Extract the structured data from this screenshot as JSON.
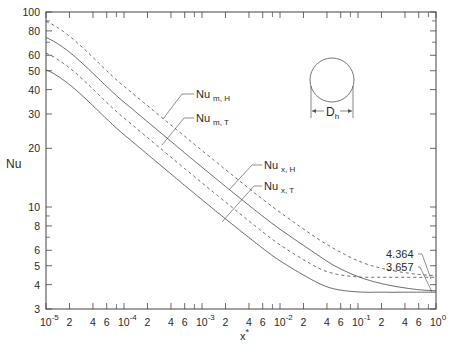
{
  "chart_data": {
    "type": "line",
    "title": "",
    "xlabel": "x*",
    "ylabel": "Nu",
    "xscale": "log",
    "yscale": "log",
    "xlim": [
      1e-05,
      1
    ],
    "ylim": [
      3,
      100
    ],
    "grid": false,
    "x_tick_labels": [
      {
        "value": 1e-05,
        "base": "10",
        "exp": "-5"
      },
      {
        "value": 2e-05,
        "label": "2"
      },
      {
        "value": 4e-05,
        "label": "4"
      },
      {
        "value": 6e-05,
        "label": "6"
      },
      {
        "value": 0.0001,
        "base": "10",
        "exp": "-4"
      },
      {
        "value": 0.0002,
        "label": "2"
      },
      {
        "value": 0.0004,
        "label": "4"
      },
      {
        "value": 0.0006,
        "label": "6"
      },
      {
        "value": 0.001,
        "base": "10",
        "exp": "-3"
      },
      {
        "value": 0.002,
        "label": "2"
      },
      {
        "value": 0.004,
        "label": "4"
      },
      {
        "value": 0.006,
        "label": "6"
      },
      {
        "value": 0.01,
        "base": "10",
        "exp": "-2"
      },
      {
        "value": 0.02,
        "label": "2"
      },
      {
        "value": 0.04,
        "label": "4"
      },
      {
        "value": 0.06,
        "label": "6"
      },
      {
        "value": 0.1,
        "base": "10",
        "exp": "-1"
      },
      {
        "value": 0.2,
        "label": "2"
      },
      {
        "value": 0.4,
        "label": "4"
      },
      {
        "value": 0.6,
        "label": "6"
      },
      {
        "value": 1,
        "base": "10",
        "exp": "0"
      }
    ],
    "y_tick_labels": [
      {
        "value": 3,
        "label": "3"
      },
      {
        "value": 4,
        "label": "4"
      },
      {
        "value": 5,
        "label": "5"
      },
      {
        "value": 6,
        "label": "6"
      },
      {
        "value": 8,
        "label": "8"
      },
      {
        "value": 10,
        "label": "10"
      },
      {
        "value": 20,
        "label": "20"
      },
      {
        "value": 30,
        "label": "30"
      },
      {
        "value": 40,
        "label": "40"
      },
      {
        "value": 50,
        "label": "50"
      },
      {
        "value": 60,
        "label": "60"
      },
      {
        "value": 80,
        "label": "80"
      },
      {
        "value": 100,
        "label": "100"
      }
    ],
    "series": [
      {
        "name": "Nu m,H",
        "label_main": "Nu",
        "label_sub": "m, H",
        "style": "dashed",
        "x": [
          1e-05,
          0.0001,
          0.001,
          0.005,
          0.01,
          0.03,
          0.05,
          0.1,
          0.2,
          0.5,
          1
        ],
        "values": [
          89.5,
          41.6,
          19.5,
          11.6,
          9.4,
          6.9,
          6.1,
          5.3,
          4.85,
          4.55,
          4.45
        ]
      },
      {
        "name": "Nu m,T",
        "label_main": "Nu",
        "label_sub": "m, T",
        "style": "solid",
        "x": [
          1e-05,
          0.0001,
          0.001,
          0.005,
          0.01,
          0.03,
          0.05,
          0.1,
          0.2,
          0.5,
          1
        ],
        "values": [
          74,
          34.5,
          16.0,
          9.5,
          7.7,
          5.7,
          5.0,
          4.4,
          4.05,
          3.8,
          3.72
        ]
      },
      {
        "name": "Nu x,H",
        "label_main": "Nu",
        "label_sub": "x, H",
        "style": "dashed",
        "x": [
          1e-05,
          0.0001,
          0.001,
          0.005,
          0.01,
          0.03,
          0.05,
          0.1,
          0.2,
          0.5,
          1
        ],
        "values": [
          61.5,
          28.6,
          13.3,
          7.9,
          6.4,
          4.9,
          4.55,
          4.38,
          4.364,
          4.364,
          4.364
        ]
      },
      {
        "name": "Nu x,T",
        "label_main": "Nu",
        "label_sub": "x, T",
        "style": "solid",
        "x": [
          1e-05,
          0.0001,
          0.001,
          0.005,
          0.01,
          0.03,
          0.05,
          0.1,
          0.2,
          0.5,
          1
        ],
        "values": [
          50.5,
          23.5,
          10.9,
          6.5,
          5.3,
          4.1,
          3.8,
          3.67,
          3.657,
          3.657,
          3.657
        ]
      }
    ],
    "annotations": [
      {
        "text": "4.364",
        "points_to": "fully developed Nu x,H / Nu m,H asymptote at x* = 1"
      },
      {
        "text": "3.657",
        "points_to": "fully developed Nu x,T / Nu m,T asymptote at x* = 1"
      },
      {
        "text": "D_h",
        "description": "circular duct cross-section with hydraulic diameter dimension"
      }
    ],
    "legend": "inline leader-line labels"
  },
  "labels": {
    "ylabel": "Nu",
    "xlabel_main": "x",
    "xlabel_sup": "*",
    "ann_4364": "4.364",
    "ann_3657": "3.657",
    "dh_main": "D",
    "dh_sub": "h"
  }
}
